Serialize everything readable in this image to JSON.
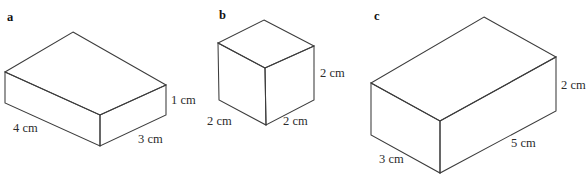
{
  "figure": {
    "background_color": "#ffffff",
    "edge_color": "#3c3c3c",
    "text_color": "#2b2b2b",
    "units": "cm"
  },
  "parts": [
    {
      "letter": "a",
      "shape": "rectangular-prism",
      "dimensions": {
        "length": "4 cm",
        "width": "3 cm",
        "height": "1 cm"
      },
      "labels": {
        "length": "4 cm",
        "width": "3 cm",
        "height": "1 cm"
      }
    },
    {
      "letter": "b",
      "shape": "cube",
      "dimensions": {
        "length": "2 cm",
        "width": "2 cm",
        "height": "2 cm"
      },
      "labels": {
        "length": "2 cm",
        "width": "2 cm",
        "height": "2 cm"
      }
    },
    {
      "letter": "c",
      "shape": "rectangular-prism",
      "dimensions": {
        "length": "5 cm",
        "width": "3 cm",
        "height": "2 cm"
      },
      "labels": {
        "length": "5 cm",
        "width": "3 cm",
        "height": "2 cm"
      }
    }
  ],
  "clipped_header": {
    "visible_fragment": ""
  }
}
